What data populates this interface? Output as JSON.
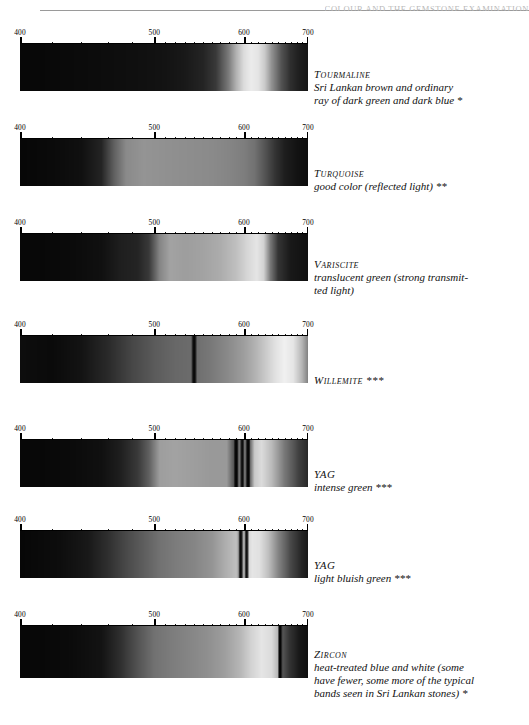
{
  "page": {
    "header_text": "COLOUR AND THE GEMSTONE EXAMINATION",
    "width": 529,
    "height": 725,
    "background": "#ffffff"
  },
  "axis": {
    "unit": "nm",
    "min": 400,
    "max": 700,
    "labels": [
      "400",
      "500",
      "600",
      "700"
    ],
    "label_values": [
      400,
      500,
      600,
      700
    ],
    "major_ticks": [
      400,
      500,
      600,
      700
    ],
    "minor_ticks": [
      420,
      440,
      460,
      480,
      510,
      520,
      530,
      540,
      550,
      560,
      570,
      580,
      590,
      610,
      620,
      630,
      640,
      650,
      660,
      670,
      680,
      690
    ],
    "scale_type": "reciprocal-wavelength"
  },
  "spectra": [
    {
      "name": "Tourmaline",
      "description_lines": [
        "Sri Lankan brown and ordinary",
        "ray of dark green and dark blue *"
      ],
      "rating": "*",
      "chart_data": {
        "type": "area",
        "title": "Tourmaline absorption spectrum",
        "xlabel": "wavelength (nm)",
        "ylabel": "transmitted intensity",
        "xlim": [
          400,
          700
        ],
        "x": [
          400,
          430,
          460,
          490,
          510,
          530,
          550,
          565,
          580,
          590,
          600,
          610,
          620,
          630,
          640,
          655,
          670,
          685,
          700
        ],
        "values": [
          0.02,
          0.03,
          0.04,
          0.05,
          0.06,
          0.08,
          0.12,
          0.2,
          0.45,
          0.68,
          0.86,
          0.93,
          0.9,
          0.78,
          0.55,
          0.3,
          0.16,
          0.1,
          0.07
        ]
      }
    },
    {
      "name": "Turquoise",
      "description_lines": [
        "good color (reflected light) **"
      ],
      "rating": "**",
      "chart_data": {
        "type": "area",
        "title": "Turquoise absorption spectrum",
        "xlabel": "wavelength (nm)",
        "ylabel": "transmitted intensity",
        "xlim": [
          400,
          700
        ],
        "x": [
          400,
          420,
          440,
          455,
          465,
          475,
          490,
          505,
          520,
          540,
          560,
          580,
          600,
          615,
          630,
          645,
          660,
          680,
          700
        ],
        "values": [
          0.02,
          0.03,
          0.05,
          0.12,
          0.35,
          0.52,
          0.56,
          0.55,
          0.54,
          0.53,
          0.52,
          0.5,
          0.47,
          0.42,
          0.3,
          0.18,
          0.1,
          0.06,
          0.04
        ]
      }
    },
    {
      "name": "Variscite",
      "description_lines": [
        "translucent green (strong transmit-",
        "ted light)"
      ],
      "rating": "",
      "chart_data": {
        "type": "area",
        "title": "Variscite absorption spectrum",
        "xlabel": "wavelength (nm)",
        "ylabel": "transmitted intensity",
        "xlim": [
          400,
          700
        ],
        "x": [
          400,
          430,
          455,
          470,
          485,
          495,
          505,
          515,
          530,
          550,
          570,
          590,
          605,
          618,
          628,
          638,
          650,
          670,
          700
        ],
        "values": [
          0.02,
          0.03,
          0.05,
          0.1,
          0.12,
          0.2,
          0.5,
          0.62,
          0.6,
          0.62,
          0.66,
          0.74,
          0.84,
          0.9,
          0.82,
          0.45,
          0.18,
          0.08,
          0.05
        ]
      }
    },
    {
      "name": "Willemite",
      "description_lines": [
        "Willemite ***"
      ],
      "rating": "***",
      "chart_data": {
        "type": "area",
        "title": "Willemite absorption spectrum",
        "xlabel": "wavelength (nm)",
        "ylabel": "transmitted intensity",
        "xlim": [
          400,
          700
        ],
        "absorption_lines": [
          540
        ],
        "x": [
          400,
          420,
          440,
          460,
          480,
          500,
          520,
          540,
          560,
          580,
          600,
          615,
          630,
          645,
          660,
          675,
          690,
          700
        ],
        "values": [
          0.04,
          0.03,
          0.06,
          0.14,
          0.25,
          0.33,
          0.38,
          0.4,
          0.45,
          0.52,
          0.6,
          0.68,
          0.78,
          0.88,
          0.95,
          0.9,
          0.7,
          0.5
        ]
      }
    },
    {
      "name": "YAG",
      "description_lines": [
        "intense green ***"
      ],
      "rating": "***",
      "chart_data": {
        "type": "area",
        "title": "YAG intense green absorption spectrum",
        "xlabel": "wavelength (nm)",
        "ylabel": "transmitted intensity",
        "xlim": [
          400,
          700
        ],
        "absorption_lines": [
          590,
          598,
          606
        ],
        "x": [
          400,
          430,
          455,
          470,
          485,
          495,
          505,
          520,
          540,
          560,
          578,
          590,
          598,
          606,
          615,
          625,
          640,
          660,
          685,
          700
        ],
        "values": [
          0.02,
          0.03,
          0.05,
          0.1,
          0.2,
          0.35,
          0.6,
          0.62,
          0.6,
          0.58,
          0.58,
          0.22,
          0.6,
          0.2,
          0.78,
          0.86,
          0.72,
          0.45,
          0.22,
          0.14
        ]
      }
    },
    {
      "name": "YAG",
      "description_lines": [
        "light bluish green ***"
      ],
      "rating": "***",
      "chart_data": {
        "type": "area",
        "title": "YAG light bluish green absorption spectrum",
        "xlabel": "wavelength (nm)",
        "ylabel": "transmitted intensity",
        "xlim": [
          400,
          700
        ],
        "absorption_lines": [
          596,
          604
        ],
        "x": [
          400,
          425,
          445,
          460,
          475,
          490,
          505,
          520,
          540,
          560,
          575,
          590,
          596,
          604,
          612,
          622,
          635,
          650,
          670,
          690,
          700
        ],
        "values": [
          0.02,
          0.04,
          0.08,
          0.16,
          0.26,
          0.34,
          0.42,
          0.46,
          0.5,
          0.56,
          0.66,
          0.74,
          0.5,
          0.82,
          0.9,
          0.88,
          0.74,
          0.5,
          0.26,
          0.12,
          0.08
        ]
      }
    },
    {
      "name": "Zircon",
      "description_lines": [
        "heat-treated blue and white (some",
        "have fewer, some more of the typical",
        "bands seen in Sri Lankan stones) *"
      ],
      "rating": "*",
      "chart_data": {
        "type": "area",
        "title": "Zircon absorption spectrum",
        "xlabel": "wavelength (nm)",
        "ylabel": "transmitted intensity",
        "xlim": [
          400,
          700
        ],
        "absorption_lines": [
          653
        ],
        "x": [
          400,
          430,
          455,
          470,
          485,
          500,
          515,
          535,
          555,
          575,
          595,
          610,
          625,
          640,
          650,
          653,
          658,
          668,
          685,
          700
        ],
        "values": [
          0.02,
          0.03,
          0.06,
          0.16,
          0.3,
          0.42,
          0.46,
          0.5,
          0.54,
          0.6,
          0.7,
          0.82,
          0.9,
          0.86,
          0.7,
          0.1,
          0.3,
          0.18,
          0.08,
          0.05
        ]
      }
    }
  ]
}
